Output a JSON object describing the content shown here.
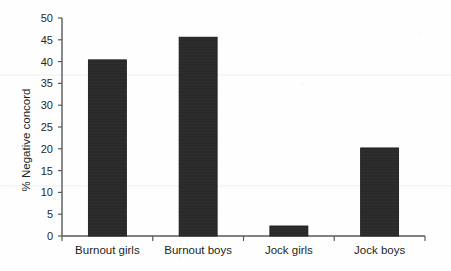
{
  "chart_data": {
    "type": "bar",
    "title": "",
    "subtitle": "",
    "xlabel": "",
    "ylabel": "% Negative concord",
    "categories": [
      "Burnout girls",
      "Burnout boys",
      "Jock girls",
      "Jock boys"
    ],
    "values": [
      40.4,
      45.6,
      2.3,
      20.2
    ],
    "series": [
      {
        "name": "% Negative concord",
        "values": [
          40.4,
          45.6,
          2.3,
          20.2
        ]
      }
    ],
    "ylim": [
      0,
      50
    ],
    "xlim": [
      0,
      4
    ],
    "y_ticks": [
      0,
      5,
      10,
      15,
      20,
      25,
      30,
      35,
      40,
      45,
      50
    ],
    "y_tick_labels": [
      "0",
      "5",
      "10",
      "15",
      "20",
      "25",
      "30",
      "35",
      "40",
      "45",
      "50"
    ],
    "grid": false,
    "legend": false,
    "legend_position": "none",
    "annotations": [],
    "bar_color": "#2a2a2a",
    "axis_color": "#555a5c",
    "background_color": "#fefefe"
  }
}
